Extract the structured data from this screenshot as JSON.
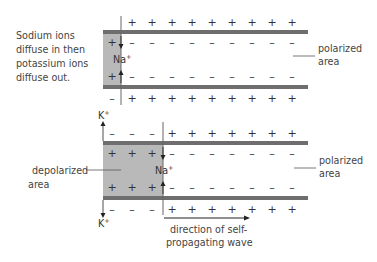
{
  "top_diagram": {
    "caption_lines": [
      "Sodium ions",
      "diffuse in then",
      "potassium ions",
      "diffuse out."
    ],
    "region_label_lines": [
      "polarized",
      "area"
    ],
    "ion_label": {
      "base": "Na",
      "charge": "+"
    },
    "outside_top_signs": [
      "+",
      "+",
      "+",
      "+",
      "+",
      "+",
      "+",
      "+",
      "+",
      "+"
    ],
    "inside_top_signs": [
      "+",
      "–",
      "–",
      "–",
      "–",
      "–",
      "–",
      "–",
      "–",
      "–"
    ],
    "inside_bottom_signs": [
      "+",
      "–",
      "–",
      "–",
      "–",
      "–",
      "–",
      "–",
      "–",
      "–"
    ],
    "outside_bottom_signs": [
      "–",
      "+",
      "+",
      "+",
      "+",
      "+",
      "+",
      "+",
      "+",
      "+"
    ]
  },
  "bottom_diagram": {
    "left_label_lines": [
      "depolarized",
      "area"
    ],
    "right_label_lines": [
      "polarized",
      "area"
    ],
    "na_label": {
      "base": "Na",
      "charge": "+"
    },
    "k_top_label": {
      "base": "K",
      "charge": "+"
    },
    "k_bottom_label": {
      "base": "K",
      "charge": "+"
    },
    "outside_top_signs": [
      "–",
      "–",
      "–",
      "+",
      "+",
      "+",
      "+",
      "+",
      "+",
      "+",
      "+",
      "+"
    ],
    "inside_top_signs": [
      "+",
      "+",
      "+",
      "–",
      "–",
      "–",
      "–",
      "–",
      "–",
      "–",
      "–",
      "–"
    ],
    "inside_bottom_signs": [
      "+",
      "+",
      "+",
      "–",
      "–",
      "–",
      "–",
      "–",
      "–",
      "–",
      "–",
      "–"
    ],
    "outside_bottom_signs": [
      "–",
      "–",
      "–",
      "+",
      "+",
      "+",
      "+",
      "+",
      "+",
      "+",
      "+",
      "+"
    ],
    "wave_label_lines": [
      "direction of self-",
      "propagating wave"
    ]
  },
  "colors": {
    "membrane": "#6e6e6e",
    "shade": "#b9b9b9",
    "line": "#555555",
    "text": "#444444"
  }
}
